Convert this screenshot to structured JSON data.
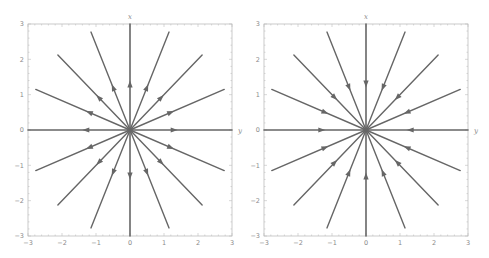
{
  "figure": {
    "panels": [
      {
        "id": "left",
        "description": "Unstable star node (source): trajectories directed outward from origin",
        "flow": "outward",
        "x_axis_label": "y",
        "y_axis_label": "x",
        "xlim": [
          -3,
          3
        ],
        "ylim": [
          -3,
          3
        ],
        "x_ticks": [
          "-3",
          "-2",
          "-1",
          "0",
          "1",
          "2",
          "3"
        ],
        "y_ticks": [
          "3",
          "2",
          "1",
          "0",
          "-1",
          "-2",
          "-3"
        ],
        "frame": {
          "x0": 28,
          "y0": 24,
          "x1": 232,
          "y1": 236
        }
      },
      {
        "id": "right",
        "description": "Stable star node (sink): trajectories directed inward to origin",
        "flow": "inward",
        "x_axis_label": "y",
        "y_axis_label": "x",
        "xlim": [
          -3,
          3
        ],
        "ylim": [
          -3,
          3
        ],
        "x_ticks": [
          "-3",
          "-2",
          "-1",
          "0",
          "1",
          "2",
          "3"
        ],
        "y_ticks": [
          "3",
          "2",
          "1",
          "0",
          "-1",
          "-2",
          "-3"
        ],
        "frame": {
          "x0": 264,
          "y0": 24,
          "x1": 468,
          "y1": 236
        }
      }
    ],
    "rays": 16,
    "ray_angle_step_deg": 22.5,
    "ray_length": 3.0,
    "arrow_position": 1.3,
    "colors": {
      "line": "#666666",
      "frame": "#bdbdbd",
      "tick_text": "#8a8a8a",
      "background": "#ffffff"
    }
  }
}
